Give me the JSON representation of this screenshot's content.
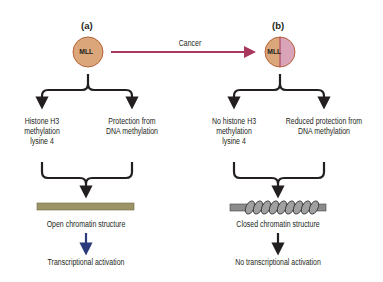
{
  "panels": {
    "a": {
      "label": "(a)",
      "circle_text": "MLL",
      "branch_left": [
        "Histone H3",
        "methylation",
        "lysine 4"
      ],
      "branch_right": [
        "Protection from",
        "DNA methylation"
      ],
      "chromatin_label": "Open chromatin structure",
      "outcome": "Transcriptional activation"
    },
    "b": {
      "label": "(b)",
      "circle_text": "MLL",
      "branch_left": [
        "No histone H3",
        "methylation",
        "lysine 4"
      ],
      "branch_right": [
        "Reduced protection from",
        "DNA methylation"
      ],
      "chromatin_label": "Closed chromatin structure",
      "outcome": "No transcriptional activation"
    }
  },
  "transition_label": "Cancer",
  "colors": {
    "mll_fill": "#dba77a",
    "mll_stroke": "#b5643c",
    "mutant_half": "#d9a3b8",
    "cancer_arrow": "#a8385e",
    "open_chromatin": "#9c9466",
    "coil": "#8c8c8c",
    "blue_arrow": "#2b3a7a"
  }
}
